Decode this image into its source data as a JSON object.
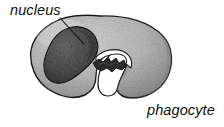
{
  "figure": {
    "kind": "biology-cell-diagram",
    "subject": "phagocyte",
    "background_color": "#ffffff",
    "labels": {
      "nucleus": "nucleus",
      "phagocyte": "phagocyte"
    },
    "colors": {
      "background": "#ffffff",
      "cytoplasm_light": "#c9c9c9",
      "cytoplasm_mid": "#aeaeae",
      "cytoplasm_shadow": "#8e8e8e",
      "cytoplasm_outline": "#1a1a1a",
      "nucleus_fill": "#5a5a5a",
      "nucleus_dark": "#3a3a3a",
      "nucleus_outline": "#141414",
      "vacuole_fill": "#ffffff",
      "particle_fill": "#2a2a2a",
      "leader_line": "#111111",
      "text": "#111111"
    },
    "parts": [
      {
        "name": "cell-body",
        "description": "rounded horseshoe-shaped phagocyte cell with stippled grey cytoplasm and dark outline"
      },
      {
        "name": "nucleus",
        "description": "dark mottled kidney-bean shaped nucleus in the upper-left of the cell"
      },
      {
        "name": "vacuole",
        "description": "white food vacuole pocket opening at the lower centre of the cell"
      },
      {
        "name": "engulfed-particle",
        "description": "jagged dark bacterium-like particle inside the vacuole"
      },
      {
        "name": "leader-line",
        "description": "thin diagonal line connecting the nucleus label to the nucleus"
      }
    ]
  }
}
